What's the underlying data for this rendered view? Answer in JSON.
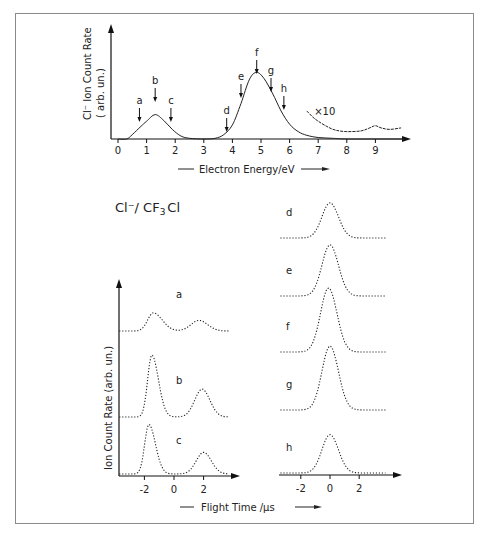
{
  "chart_data": [
    {
      "type": "line",
      "title": "",
      "xlabel": "Electron Energy/eV",
      "ylabel": "Cl⁻ Ion Count Rate (arb. un.)",
      "xlim": [
        0,
        10
      ],
      "xticks": [
        0,
        1,
        2,
        3,
        4,
        5,
        6,
        7,
        8,
        9
      ],
      "grid": false,
      "series": [
        {
          "name": "Cl- yield",
          "x": [
            0,
            0.3,
            0.5,
            0.8,
            1.0,
            1.3,
            1.6,
            1.9,
            2.2,
            2.5,
            3.0,
            3.4,
            3.7,
            4.0,
            4.3,
            4.6,
            4.85,
            5.1,
            5.4,
            5.7,
            6.0,
            6.3,
            6.6,
            7.0,
            7.5,
            8.0,
            9.0,
            10.0
          ],
          "y": [
            0,
            0,
            0.06,
            0.17,
            0.24,
            0.33,
            0.25,
            0.13,
            0.04,
            0.01,
            0,
            0.01,
            0.06,
            0.19,
            0.48,
            0.81,
            0.9,
            0.82,
            0.62,
            0.38,
            0.2,
            0.1,
            0.05,
            0.02,
            0.01,
            0,
            0,
            0
          ]
        },
        {
          "name": "x10",
          "x": [
            6.6,
            6.8,
            7.0,
            7.3,
            7.6,
            8.0,
            8.5,
            8.8,
            9.0,
            9.2,
            9.5,
            9.9
          ],
          "y": [
            0.38,
            0.3,
            0.24,
            0.17,
            0.12,
            0.1,
            0.11,
            0.15,
            0.18,
            0.15,
            0.13,
            0.15
          ]
        }
      ],
      "annotations": [
        {
          "label": "a",
          "x": 0.75
        },
        {
          "label": "b",
          "x": 1.3
        },
        {
          "label": "c",
          "x": 1.85
        },
        {
          "label": "d",
          "x": 3.8
        },
        {
          "label": "e",
          "x": 4.3
        },
        {
          "label": "f",
          "x": 4.85
        },
        {
          "label": "g",
          "x": 5.35
        },
        {
          "label": "h",
          "x": 5.8
        },
        {
          "label": "×10",
          "x": 7.0
        }
      ]
    },
    {
      "type": "line",
      "title": "Cl⁻/ CF₃Cl",
      "xlabel": "Flight Time /µs",
      "ylabel": "Ion Count Rate (arb. un.)",
      "xticks": [
        -2,
        0,
        2
      ],
      "panels": [
        {
          "column": "left",
          "label": "a",
          "peaks": [
            {
              "t": -1.4,
              "h": 0.65
            },
            {
              "t": 1.7,
              "h": 0.38
            }
          ]
        },
        {
          "column": "left",
          "label": "b",
          "peaks": [
            {
              "t": -1.5,
              "h": 1.0
            },
            {
              "t": 1.9,
              "h": 0.45
            }
          ]
        },
        {
          "column": "left",
          "label": "c",
          "peaks": [
            {
              "t": -1.7,
              "h": 0.8
            },
            {
              "t": 2.0,
              "h": 0.35
            }
          ]
        },
        {
          "column": "right",
          "label": "d",
          "peaks": [
            {
              "t": 0.0,
              "h": 0.55
            }
          ]
        },
        {
          "column": "right",
          "label": "e",
          "peaks": [
            {
              "t": 0.0,
              "h": 0.8
            }
          ]
        },
        {
          "column": "right",
          "label": "f",
          "peaks": [
            {
              "t": -0.1,
              "h": 1.0
            }
          ]
        },
        {
          "column": "right",
          "label": "g",
          "peaks": [
            {
              "t": 0.0,
              "h": 1.0
            }
          ]
        },
        {
          "column": "right",
          "label": "h",
          "peaks": [
            {
              "t": 0.0,
              "h": 0.6
            }
          ]
        }
      ]
    }
  ],
  "labels": {
    "top_ylabel_1": "Cl⁻ Ion Count Rate",
    "top_ylabel_2": "( arb. un.)",
    "top_xlabel": "Electron Energy/eV",
    "x10": "×10",
    "bottom_title_main": "Cl⁻/ CF",
    "bottom_title_sub": "3",
    "bottom_title_end": "Cl",
    "bottom_ylabel": "Ion Count Rate (arb. un.)",
    "bottom_xlabel": "Flight Time /µs"
  }
}
